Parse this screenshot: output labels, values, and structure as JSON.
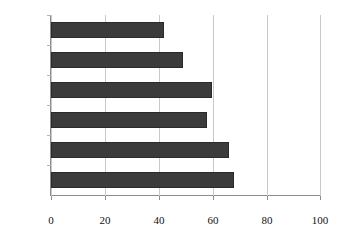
{
  "chart_data": {
    "type": "bar",
    "orientation": "horizontal",
    "title": "",
    "subtitle": "",
    "xlabel": "",
    "ylabel": "",
    "categories": [
      "18-29",
      "30-39",
      "40-49",
      "50-59",
      "60-69",
      "70+"
    ],
    "values": [
      42,
      49,
      60,
      58,
      66,
      68
    ],
    "series": [
      {
        "name": "",
        "values": [
          42,
          49,
          60,
          58,
          66,
          68
        ]
      }
    ],
    "xlim": [
      0,
      100
    ],
    "xticks": [
      0,
      20,
      40,
      60,
      80,
      100
    ],
    "xtick_labels": [
      "0",
      "20",
      "40",
      "60",
      "80",
      "100"
    ],
    "grid": "vertical",
    "legend": "none",
    "annotations": []
  },
  "style": {
    "bar_color": "#3b3b3b",
    "bar_edge_color": "#2a2a2a",
    "gridline_color": "#c9c9c9",
    "axis_color": "#8c8c8c",
    "background_color": "#ffffff",
    "text_color": "#111111"
  }
}
